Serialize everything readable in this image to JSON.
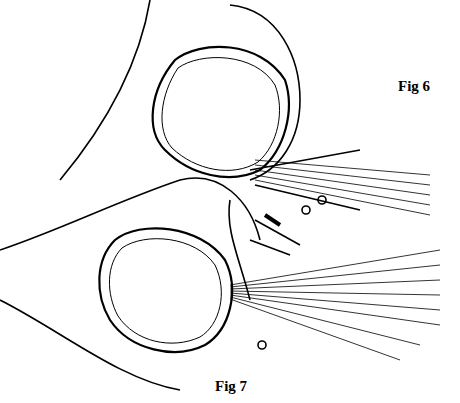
{
  "figures": [
    {
      "label": "Fig 6",
      "x": 398,
      "y": 78
    },
    {
      "label": "Fig 7",
      "x": 215,
      "y": 378
    }
  ]
}
